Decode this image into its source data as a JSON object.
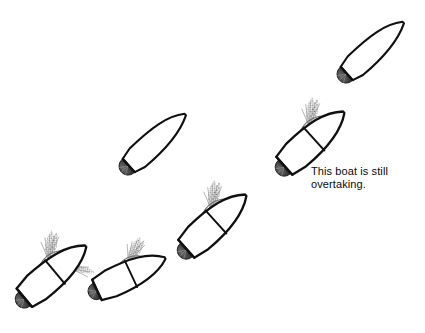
{
  "figure": {
    "kind": "line-diagram",
    "background_color": "#ffffff",
    "stroke_color": "#101010",
    "wake_color": "#8c8c8c",
    "stern_blob_color": "#4a4a4a",
    "width": 425,
    "height": 333
  },
  "annotation": {
    "label": "This boat is still\novertaking.",
    "line1": "This boat is still",
    "line2": "overtaking.",
    "x": 311,
    "y": 165,
    "font_size": 11,
    "color": "#0a0a0a"
  },
  "boats": [
    {
      "id": "boat-1",
      "name": "boat-top-right",
      "sequence": 1,
      "hull_style": "narrow-plain",
      "x": 375,
      "y": 48,
      "heading_deg": -42,
      "length": 78,
      "beam": 22,
      "has_bow_spray": false,
      "has_side_spray": false,
      "has_stern_wake": true
    },
    {
      "id": "boat-2",
      "name": "boat-overtaking-annotated",
      "sequence": 2,
      "hull_style": "wide-spray",
      "x": 314,
      "y": 139,
      "heading_deg": -42,
      "length": 80,
      "beam": 30,
      "has_bow_spray": true,
      "has_side_spray": false,
      "has_stern_wake": true
    },
    {
      "id": "boat-3",
      "name": "boat-middle",
      "sequence": 3,
      "hull_style": "narrow-plain",
      "x": 157,
      "y": 140,
      "heading_deg": -42,
      "length": 78,
      "beam": 22,
      "has_bow_spray": false,
      "has_side_spray": false,
      "has_stern_wake": true
    },
    {
      "id": "boat-4",
      "name": "boat-lower-middle",
      "sequence": 4,
      "hull_style": "wide-spray",
      "x": 216,
      "y": 222,
      "heading_deg": -42,
      "length": 80,
      "beam": 30,
      "has_bow_spray": true,
      "has_side_spray": false,
      "has_stern_wake": true
    },
    {
      "id": "boat-5",
      "name": "boat-bottom-middle",
      "sequence": 5,
      "hull_style": "wide-spray",
      "x": 131,
      "y": 274,
      "heading_deg": -25,
      "length": 72,
      "beam": 28,
      "has_bow_spray": true,
      "has_side_spray": false,
      "has_stern_wake": true
    },
    {
      "id": "boat-6",
      "name": "boat-bottom-left",
      "sequence": 6,
      "hull_style": "wide-spray",
      "x": 55,
      "y": 272,
      "heading_deg": -40,
      "length": 78,
      "beam": 30,
      "has_bow_spray": true,
      "has_side_spray": true,
      "has_stern_wake": true
    }
  ]
}
